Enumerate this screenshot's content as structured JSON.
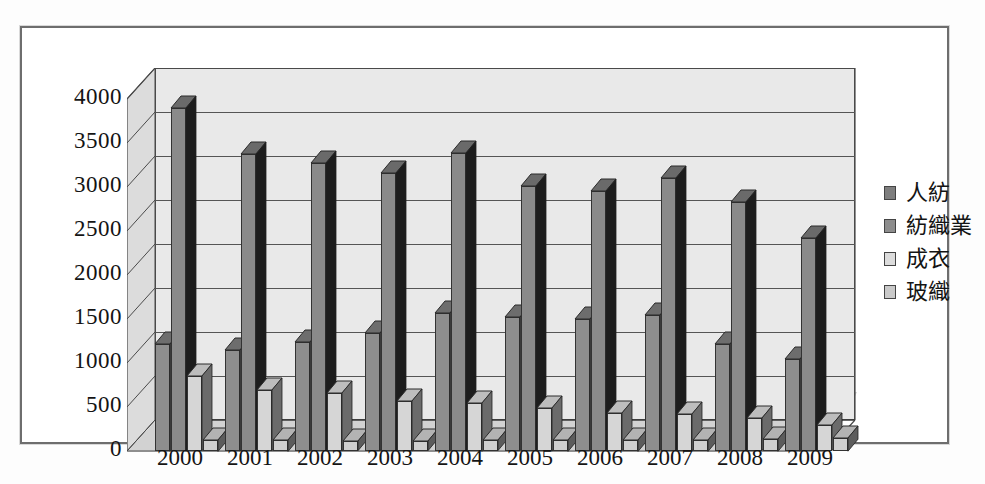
{
  "chart_data": {
    "type": "bar",
    "title": "",
    "subtitle": "",
    "xlabel": "",
    "ylabel": "",
    "ylim": [
      0,
      4000
    ],
    "ytick_step": 500,
    "grid": true,
    "legend_position": "right",
    "three_d": true,
    "categories": [
      "2000",
      "2001",
      "2002",
      "2003",
      "2004",
      "2005",
      "2006",
      "2007",
      "2008",
      "2009"
    ],
    "ytick_labels": [
      "4000",
      "3500",
      "3000",
      "2500",
      "2000",
      "1500",
      "1000",
      "500",
      "0"
    ],
    "series": [
      {
        "name": "人紡",
        "color": "#8e8e8e",
        "values": [
          1220,
          1150,
          1240,
          1340,
          1570,
          1520,
          1500,
          1540,
          1220,
          1050
        ]
      },
      {
        "name": "紡織業",
        "color": "#8a8a8a",
        "values": [
          3900,
          3370,
          3270,
          3160,
          3390,
          3010,
          2950,
          3100,
          2830,
          2420
        ]
      },
      {
        "name": "成衣",
        "color": "#d6d6d6",
        "values": [
          850,
          690,
          660,
          570,
          550,
          490,
          430,
          420,
          370,
          290
        ]
      },
      {
        "name": "玻織",
        "color": "#cfcfcf",
        "values": [
          130,
          130,
          110,
          110,
          120,
          130,
          130,
          130,
          140,
          150
        ]
      }
    ]
  },
  "legend": {
    "items": [
      {
        "label": "人紡"
      },
      {
        "label": "紡織業"
      },
      {
        "label": "成衣"
      },
      {
        "label": "玻織"
      }
    ]
  }
}
